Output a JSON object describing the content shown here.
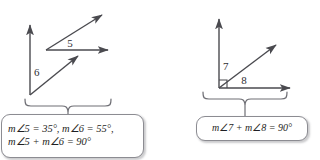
{
  "figure": {
    "colors": {
      "line": "#4a4a4f",
      "brace": "#6e6e74",
      "text": "#1f1f24",
      "box_border": "#8c8c92",
      "background": "#ffffff"
    }
  },
  "left_diagram": {
    "name": "two separate complementary angles",
    "labels": {
      "angle5": "5",
      "angle6": "6"
    }
  },
  "right_diagram": {
    "name": "adjacent complementary angles forming a right angle",
    "labels": {
      "angle7": "7",
      "angle8": "8"
    }
  },
  "callout_left": {
    "line1": "m∠5 = 35°, m∠6 = 55°,",
    "line2": "m∠5 +  m∠6 = 90°"
  },
  "callout_right": {
    "line1": "m∠7 +  m∠8 = 90°"
  }
}
